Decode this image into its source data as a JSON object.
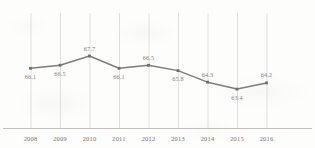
{
  "chart_data": {
    "type": "line",
    "title": "",
    "subtitle": "",
    "xlabel": "",
    "ylabel": "",
    "categories": [
      "2008",
      "2009",
      "2010",
      "2011",
      "2012",
      "2013",
      "2014",
      "2015",
      "2016"
    ],
    "values": [
      66.1,
      66.5,
      67.7,
      66.1,
      66.5,
      65.8,
      64.3,
      63.4,
      64.2
    ],
    "data_labels": [
      "66.1",
      "66.5",
      "67.7",
      "66.1",
      "66.5",
      "65.8",
      "64.3",
      "63.4",
      "64.2"
    ],
    "label_positions": [
      "below",
      "below",
      "above",
      "below",
      "above",
      "below",
      "above",
      "below",
      "above"
    ],
    "ylim": [
      62.5,
      69.0
    ],
    "grid": "vertical",
    "legend": "none",
    "series": [
      {
        "name": "series-1",
        "values": [
          66.1,
          66.5,
          67.7,
          66.1,
          66.5,
          65.8,
          64.3,
          63.4,
          64.2
        ]
      }
    ],
    "colors": {
      "line": "#7e7d79",
      "marker": "#6e6d69",
      "grid": "#d8d8d4",
      "axis": "#c2c1bc",
      "text": "#6f6d69",
      "background": "#fdfdfc"
    }
  }
}
